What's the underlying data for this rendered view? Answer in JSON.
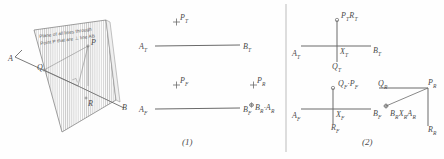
{
  "figure": {
    "divider": true,
    "stroke_color": "#6b6b6b",
    "hatch_color": "#9a9a9a",
    "text_color": "#4a4a4a"
  },
  "panel_pictorial": {
    "name": "pictorial-3d-view",
    "plane_note_line1": "Plane of all lines through",
    "plane_note_line2": "Point P that are ⊥ line AB",
    "points": [
      {
        "id": "A",
        "label": "A",
        "x": 9,
        "y": 60
      },
      {
        "id": "P",
        "label": "P",
        "x": 80,
        "y": 44
      },
      {
        "id": "Q",
        "label": "Q",
        "x": 38,
        "y": 69
      },
      {
        "id": "R",
        "label": "R",
        "x": 90,
        "y": 104
      },
      {
        "id": "B",
        "label": "B",
        "x": 119,
        "y": 112
      }
    ]
  },
  "panel_one": {
    "name": "orthographic-step-1",
    "caption": "(1)",
    "top_view": {
      "line_label_left": "A",
      "line_label_left_sub": "T",
      "line_label_right": "B",
      "line_label_right_sub": "T",
      "point_label": "P",
      "point_label_sub": "T",
      "point_marker": "+"
    },
    "front_view": {
      "line_label_left": "A",
      "line_label_left_sub": "F",
      "line_label_right": "B",
      "line_label_right_sub": "F",
      "point_label": "P",
      "point_label_sub": "F",
      "point_marker": "+"
    },
    "aux_view": {
      "point_label": "P",
      "point_label_sub": "R",
      "point_marker": "+",
      "endpoint_label": "B",
      "endpoint_label_sub": "R",
      "endpoint_label2": "A",
      "endpoint_label2_sub": "R",
      "endpoint_separator": "·",
      "endpoint_marker": "⊕"
    }
  },
  "panel_two": {
    "name": "orthographic-step-2",
    "caption": "(2)",
    "top_view": {
      "label_A": "A",
      "label_A_sub": "T",
      "label_B": "B",
      "label_B_sub": "T",
      "label_X": "X",
      "label_X_sub": "T",
      "label_Q": "Q",
      "label_Q_sub": "T",
      "label_PR": "P",
      "label_PR_sub": "T",
      "label_PR2": "R",
      "label_PR2_sub": "T"
    },
    "front_view": {
      "label_A": "A",
      "label_A_sub": "F",
      "label_B": "B",
      "label_B_sub": "F",
      "label_X": "X",
      "label_X_sub": "F",
      "label_Q": "Q",
      "label_Q_sub": "F",
      "label_P": "P",
      "label_P_sub": "F",
      "label_separator": "·",
      "label_R": "R",
      "label_R_sub": "F"
    },
    "aux_view": {
      "label_Q": "Q",
      "label_Q_sub": "R",
      "label_P": "P",
      "label_P_sub": "R",
      "label_R": "R",
      "label_R_sub": "R",
      "label_B": "B",
      "label_B_sub": "R",
      "label_X": "X",
      "label_X_sub": "R",
      "label_A": "A",
      "label_A_sub": "R"
    }
  }
}
